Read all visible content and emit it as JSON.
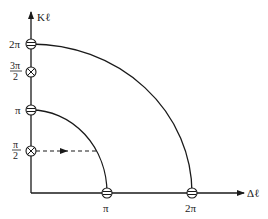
{
  "axes": {
    "y_label": "Kℓ",
    "x_label": "Δℓ"
  },
  "y_ticks": [
    {
      "label": "2π",
      "marker": "minus-circle"
    },
    {
      "label_num": "3π",
      "label_den": "2",
      "marker": "cross-circle"
    },
    {
      "label": "π",
      "marker": "minus-circle"
    },
    {
      "label_num": "π",
      "label_den": "2",
      "marker": "cross-circle"
    }
  ],
  "x_ticks": [
    {
      "label": "π",
      "marker": "minus-circle"
    },
    {
      "label": "2π",
      "marker": "minus-circle"
    }
  ],
  "curves": [
    {
      "name": "inner-arc",
      "radius": "π"
    },
    {
      "name": "outer-arc",
      "radius": "2π"
    }
  ],
  "dashed_arrow": {
    "from": "π/2",
    "direction": "right"
  },
  "colors": {
    "stroke": "#1a1a1a",
    "background": "#ffffff"
  }
}
